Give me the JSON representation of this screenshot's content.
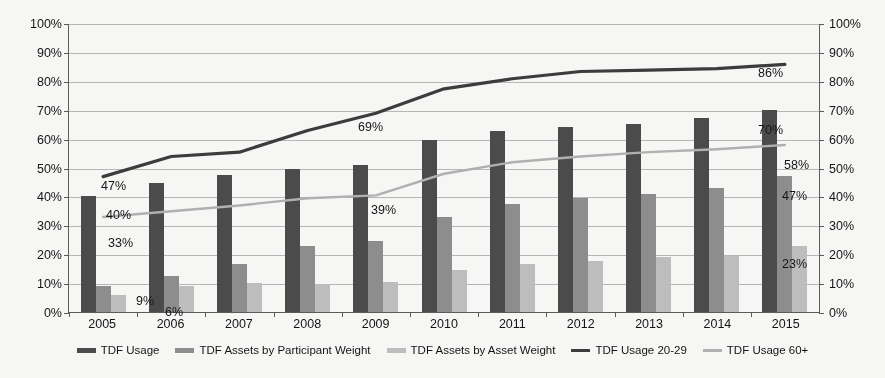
{
  "chart_data": {
    "type": "bar",
    "title": "",
    "subtitle": "",
    "xlabel": "",
    "ylabel": "",
    "ylabel_right": "",
    "ylim": [
      0,
      100
    ],
    "y_ticks": [
      "0%",
      "10%",
      "20%",
      "30%",
      "40%",
      "50%",
      "60%",
      "70%",
      "80%",
      "90%",
      "100%"
    ],
    "y_ticks_right": [
      "0%",
      "10%",
      "20%",
      "30%",
      "40%",
      "50%",
      "60%",
      "70%",
      "80%",
      "90%",
      "100%"
    ],
    "grid": true,
    "legend_position": "bottom",
    "categories": [
      "2005",
      "2006",
      "2007",
      "2008",
      "2009",
      "2010",
      "2011",
      "2012",
      "2013",
      "2014",
      "2015"
    ],
    "series": [
      {
        "name": "TDF Usage",
        "kind": "bar",
        "color": "#4a4a4a",
        "values": [
          40,
          44.5,
          47.5,
          49.5,
          51,
          59.5,
          62.5,
          64,
          65,
          67,
          70
        ]
      },
      {
        "name": "TDF Assets by Participant Weight",
        "kind": "bar",
        "color": "#8e8e8e",
        "values": [
          9,
          12.5,
          16.5,
          23,
          24.5,
          33,
          37.5,
          39.5,
          41,
          43,
          47
        ]
      },
      {
        "name": "TDF Assets by Asset Weight",
        "kind": "bar",
        "color": "#c0c0c0",
        "values": [
          6,
          9,
          10,
          9.8,
          10.5,
          14.5,
          16.5,
          17.5,
          19,
          19.5,
          23
        ]
      },
      {
        "name": "TDF Usage 20-29",
        "kind": "line",
        "color": "#3a3a3a",
        "values": [
          47,
          54,
          55.5,
          63,
          69,
          77.5,
          81,
          83.5,
          84,
          84.5,
          86
        ]
      },
      {
        "name": "TDF Usage 60+",
        "kind": "line",
        "color": "#b2b2b2",
        "values": [
          33,
          35,
          37,
          39.5,
          40.5,
          48,
          52,
          54,
          55.5,
          56.5,
          58
        ]
      }
    ],
    "data_labels": [
      {
        "text": "40%",
        "series": "TDF Usage",
        "category": "2005",
        "x": 38,
        "y": 185
      },
      {
        "text": "9%",
        "series": "TDF Assets by Participant Weight",
        "category": "2005",
        "x": 68,
        "y": 271
      },
      {
        "text": "6%",
        "series": "TDF Assets by Asset Weight",
        "category": "2005",
        "x": 97,
        "y": 282
      },
      {
        "text": "47%",
        "series": "TDF Usage 20-29",
        "category": "2005",
        "x": 33,
        "y": 156
      },
      {
        "text": "33%",
        "series": "TDF Usage 60+",
        "category": "2005",
        "x": 40,
        "y": 213
      },
      {
        "text": "69%",
        "series": "TDF Usage 20-29",
        "category": "2009",
        "x": 290,
        "y": 97
      },
      {
        "text": "39%",
        "series": "TDF Usage 60+",
        "category": "2009",
        "x": 303,
        "y": 180
      },
      {
        "text": "86%",
        "series": "TDF Usage 20-29",
        "category": "2015",
        "x": 690,
        "y": 43
      },
      {
        "text": "70%",
        "series": "TDF Usage",
        "category": "2015",
        "x": 690,
        "y": 100
      },
      {
        "text": "58%",
        "series": "TDF Usage 60+",
        "category": "2015",
        "x": 716,
        "y": 135
      },
      {
        "text": "47%",
        "series": "TDF Assets by Participant Weight",
        "category": "2015",
        "x": 714,
        "y": 166
      },
      {
        "text": "23%",
        "series": "TDF Assets by Asset Weight",
        "category": "2015",
        "x": 714,
        "y": 234
      }
    ]
  }
}
